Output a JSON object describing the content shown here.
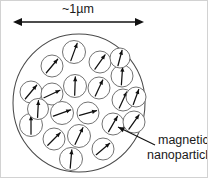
{
  "figure": {
    "background_color": "#ffffff",
    "outline_color": "#4a4a4a",
    "particle_outline_color": "#6b6b6b",
    "arrow_color": "#111111",
    "text_color": "#1a1a1a"
  },
  "scale_bar": {
    "label": "~1µm",
    "label_x": 78,
    "label_y": 13,
    "line_y": 22,
    "x_start": 13,
    "x_end": 144,
    "arrowheads": "both"
  },
  "host_particle": {
    "name": "host-sphere",
    "cx": 79,
    "cy": 103,
    "rx": 66,
    "ry": 69
  },
  "callout": {
    "line1": "magnetic",
    "line2": "nanoparticles",
    "text_x": 158,
    "line1_y": 144,
    "line2_y": 159,
    "leader_from_x": 155,
    "leader_from_y": 145,
    "leader_to_x": 118,
    "leader_to_y": 127
  },
  "nanoparticles": [
    {
      "id": 1,
      "cx": 74,
      "cy": 52,
      "r": 11.5,
      "angle_deg": 20
    },
    {
      "id": 2,
      "cx": 100,
      "cy": 62,
      "r": 11.0,
      "angle_deg": 35
    },
    {
      "id": 3,
      "cx": 122,
      "cy": 76,
      "r": 11.0,
      "angle_deg": 4
    },
    {
      "id": 4,
      "cx": 52,
      "cy": 66,
      "r": 11.0,
      "angle_deg": 40
    },
    {
      "id": 5,
      "cx": 75,
      "cy": 86,
      "r": 11.5,
      "angle_deg": 2
    },
    {
      "id": 6,
      "cx": 99,
      "cy": 88,
      "r": 11.0,
      "angle_deg": 25
    },
    {
      "id": 7,
      "cx": 123,
      "cy": 100,
      "r": 11.0,
      "angle_deg": 25
    },
    {
      "id": 8,
      "cx": 31,
      "cy": 92,
      "r": 11.0,
      "angle_deg": 40
    },
    {
      "id": 9,
      "cx": 52,
      "cy": 94,
      "r": 11.0,
      "angle_deg": 65
    },
    {
      "id": 10,
      "cx": 62,
      "cy": 113,
      "r": 11.5,
      "angle_deg": 70
    },
    {
      "id": 11,
      "cx": 88,
      "cy": 113,
      "r": 11.0,
      "angle_deg": 75
    },
    {
      "id": 12,
      "cx": 31,
      "cy": 125,
      "r": 11.5,
      "angle_deg": 0
    },
    {
      "id": 13,
      "cx": 113,
      "cy": 124,
      "r": 11.0,
      "angle_deg": 30
    },
    {
      "id": 14,
      "cx": 134,
      "cy": 122,
      "r": 11.0,
      "angle_deg": 35
    },
    {
      "id": 15,
      "cx": 54,
      "cy": 139,
      "r": 11.0,
      "angle_deg": 45
    },
    {
      "id": 16,
      "cx": 79,
      "cy": 136,
      "r": 11.5,
      "angle_deg": 25
    },
    {
      "id": 17,
      "cx": 103,
      "cy": 149,
      "r": 11.0,
      "angle_deg": 50
    },
    {
      "id": 18,
      "cx": 71,
      "cy": 159,
      "r": 11.5,
      "angle_deg": 5
    },
    {
      "id": 19,
      "cx": 120,
      "cy": 58,
      "r": 10.0,
      "angle_deg": 15
    },
    {
      "id": 20,
      "cx": 38,
      "cy": 109,
      "r": 10.5,
      "angle_deg": 3
    },
    {
      "id": 21,
      "cx": 136,
      "cy": 97,
      "r": 10.0,
      "angle_deg": 20
    }
  ]
}
